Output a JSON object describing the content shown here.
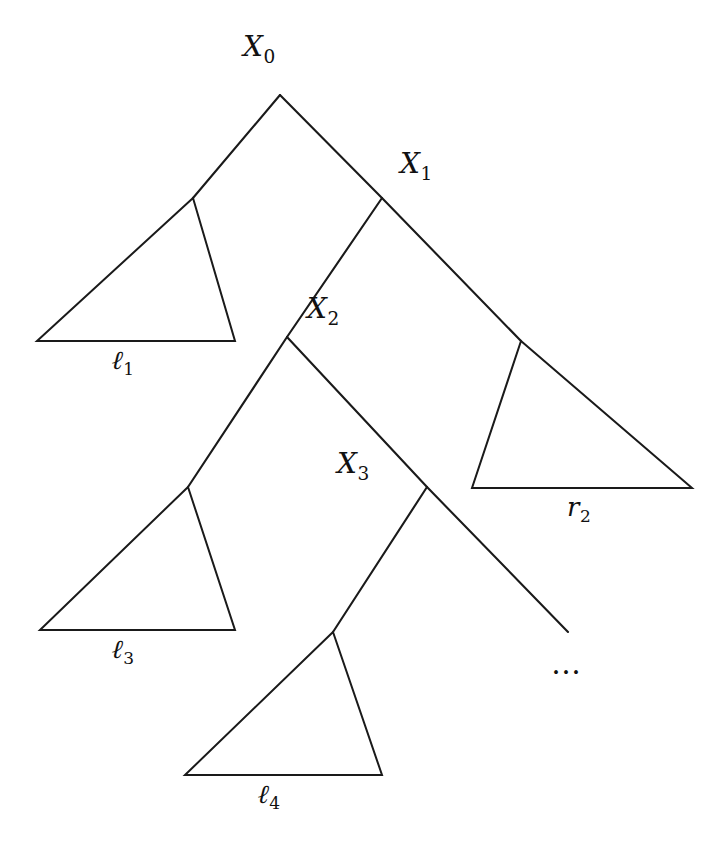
{
  "figure": {
    "kind": "binary-tree-decomposition",
    "background_color": "#ffffff",
    "ink_color": "#1a1a1a",
    "width": 727,
    "height": 857
  },
  "nodes": [
    {
      "id": "X0",
      "base": "X",
      "sub": "0",
      "x": 280,
      "y": 95,
      "label_x": 243,
      "label_y": 33
    },
    {
      "id": "X1",
      "base": "X",
      "sub": "1",
      "x": 382,
      "y": 198,
      "label_x": 400,
      "label_y": 150
    },
    {
      "id": "X2",
      "base": "X",
      "sub": "2",
      "x": 287,
      "y": 337,
      "label_x": 307,
      "label_y": 295
    },
    {
      "id": "X3",
      "base": "X",
      "sub": "3",
      "x": 427,
      "y": 487,
      "label_x": 337,
      "label_y": 450
    }
  ],
  "spine_edges": [
    {
      "from": "X0",
      "to": "X1",
      "x1": 280,
      "y1": 95,
      "x2": 382,
      "y2": 198
    },
    {
      "from": "X1",
      "to": "X2",
      "x1": 382,
      "y1": 198,
      "x2": 287,
      "y2": 337
    },
    {
      "from": "X2",
      "to": "X3",
      "x1": 287,
      "y1": 337,
      "x2": 427,
      "y2": 487
    }
  ],
  "subtree_edges": [
    {
      "name": "X0-to-l1",
      "x1": 280,
      "y1": 95,
      "x2": 193,
      "y2": 198
    },
    {
      "name": "X1-to-r2",
      "x1": 382,
      "y1": 198,
      "x2": 521,
      "y2": 341
    },
    {
      "name": "X2-to-l3",
      "x1": 287,
      "y1": 337,
      "x2": 188,
      "y2": 487
    },
    {
      "name": "X3-to-l4",
      "x1": 427,
      "y1": 487,
      "x2": 333,
      "y2": 632
    }
  ],
  "dangling_edge": {
    "name": "X3-continues",
    "x1": 427,
    "y1": 487,
    "x2": 568,
    "y2": 632
  },
  "triangles": [
    {
      "id": "l1",
      "base": "ℓ",
      "sub": "1",
      "orientation": "left-leaning",
      "apex_x": 193,
      "apex_y": 198,
      "base_left_x": 37,
      "base_left_y": 341,
      "base_right_x": 235,
      "base_right_y": 341,
      "label_x": 112,
      "label_y": 347
    },
    {
      "id": "r2",
      "base": "r",
      "sub": "2",
      "orientation": "right-leaning",
      "apex_x": 521,
      "apex_y": 341,
      "base_left_x": 472,
      "base_left_y": 488,
      "base_right_x": 692,
      "base_right_y": 488,
      "label_x": 567,
      "label_y": 494
    },
    {
      "id": "l3",
      "base": "ℓ",
      "sub": "3",
      "orientation": "left-leaning",
      "apex_x": 188,
      "apex_y": 487,
      "base_left_x": 40,
      "base_left_y": 630,
      "base_right_x": 235,
      "base_right_y": 630,
      "label_x": 112,
      "label_y": 636
    },
    {
      "id": "l4",
      "base": "ℓ",
      "sub": "4",
      "orientation": "left-leaning",
      "apex_x": 333,
      "apex_y": 632,
      "base_left_x": 185,
      "base_left_y": 775,
      "base_right_x": 382,
      "base_right_y": 775,
      "label_x": 258,
      "label_y": 781
    }
  ],
  "ellipsis": {
    "text": "…",
    "x": 551,
    "y": 646
  }
}
